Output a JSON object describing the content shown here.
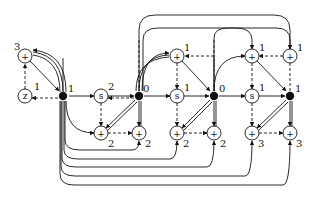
{
  "diagram": {
    "type": "flow-network",
    "nodes": [
      {
        "id": "plus_top_left",
        "kind": "plus",
        "symbol": "+",
        "label": "3",
        "x": 25,
        "y": 56
      },
      {
        "id": "z",
        "kind": "circle",
        "symbol": "z",
        "label": "1",
        "x": 25,
        "y": 96
      },
      {
        "id": "j1",
        "kind": "junction",
        "label": "1",
        "x": 63,
        "y": 96
      },
      {
        "id": "s1",
        "kind": "circle",
        "symbol": "s",
        "label": "2",
        "x": 101,
        "y": 96
      },
      {
        "id": "j2",
        "kind": "junction",
        "label": "0",
        "x": 139,
        "y": 96
      },
      {
        "id": "plus_a_top",
        "kind": "plus",
        "symbol": "+",
        "label": "1",
        "x": 177,
        "y": 56
      },
      {
        "id": "s2",
        "kind": "circle",
        "symbol": "s",
        "label": "1",
        "x": 177,
        "y": 96
      },
      {
        "id": "j3",
        "kind": "junction",
        "label": "0",
        "x": 214,
        "y": 96
      },
      {
        "id": "plus_b_top",
        "kind": "plus",
        "symbol": "+",
        "label": "1",
        "x": 252,
        "y": 56
      },
      {
        "id": "s3",
        "kind": "circle",
        "symbol": "s",
        "label": "1",
        "x": 252,
        "y": 96
      },
      {
        "id": "j4",
        "kind": "junction",
        "label": "1",
        "x": 290,
        "y": 96
      },
      {
        "id": "plus_c_top",
        "kind": "plus",
        "symbol": "+",
        "label": "1",
        "x": 290,
        "y": 56
      },
      {
        "id": "p1a",
        "kind": "plus",
        "symbol": "+",
        "label": "2",
        "x": 101,
        "y": 133
      },
      {
        "id": "p1b",
        "kind": "plus",
        "symbol": "+",
        "label": "2",
        "x": 139,
        "y": 133
      },
      {
        "id": "p2a",
        "kind": "plus",
        "symbol": "+",
        "label": "2",
        "x": 177,
        "y": 133
      },
      {
        "id": "p2b",
        "kind": "plus",
        "symbol": "+",
        "label": "2",
        "x": 214,
        "y": 133
      },
      {
        "id": "p3a",
        "kind": "plus",
        "symbol": "+",
        "label": "3",
        "x": 252,
        "y": 133
      },
      {
        "id": "p3b",
        "kind": "plus",
        "symbol": "+",
        "label": "3",
        "x": 290,
        "y": 133
      }
    ]
  }
}
